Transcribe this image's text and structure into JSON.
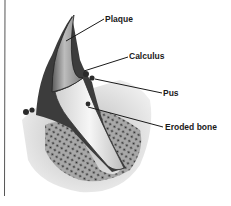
{
  "diagram": {
    "labels": [
      {
        "id": "plaque",
        "text": "Plaque"
      },
      {
        "id": "calculus",
        "text": "Calculus"
      },
      {
        "id": "pus",
        "text": "Pus"
      },
      {
        "id": "eroded-bone",
        "text": "Eroded bone"
      }
    ],
    "colors": {
      "background": "#ffffff",
      "ink": "#1a1a1a",
      "enamel": "#e8e8e8",
      "gum": "#3a3a3a",
      "bone": "#9a9a9a"
    }
  }
}
